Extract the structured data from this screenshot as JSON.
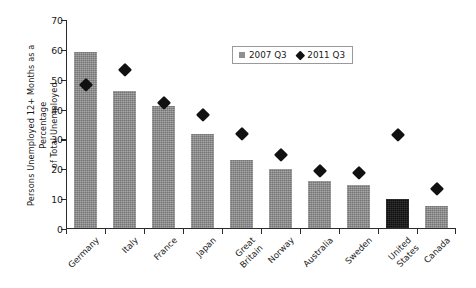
{
  "chart_data": {
    "type": "bar",
    "title": "",
    "xlabel": "",
    "ylabel": "Persons Unemployed 12+ Months as a Percentage\nof Total Unemployed",
    "ylim": [
      0,
      70
    ],
    "ytick_labels": [
      "0",
      "10",
      "20",
      "30",
      "40",
      "50",
      "60",
      "70"
    ],
    "ytick_values": [
      0,
      10,
      20,
      30,
      40,
      50,
      60,
      70
    ],
    "grid": false,
    "legend_position": "upper center",
    "categories": [
      "Germany",
      "Italy",
      "France",
      "Japan",
      "Great\nBritain",
      "Norway",
      "Australia",
      "Sweden",
      "United\nStates",
      "Canada"
    ],
    "series": [
      {
        "name": "2007 Q3",
        "marker": "square",
        "color": "#8f8f8f",
        "values": [
          59,
          46,
          41,
          31.5,
          23,
          20,
          16,
          14.5,
          10,
          7.5
        ]
      },
      {
        "name": "2011 Q3",
        "marker": "diamond",
        "color": "#111111",
        "values": [
          48.5,
          53.5,
          42.5,
          38.5,
          32,
          25,
          19.5,
          19,
          31.5,
          13.5
        ]
      }
    ],
    "highlight_category": "United States",
    "highlight_color": "#141414"
  },
  "legend": {
    "entries": [
      {
        "label": "2007 Q3"
      },
      {
        "label": "2011 Q3"
      }
    ]
  }
}
